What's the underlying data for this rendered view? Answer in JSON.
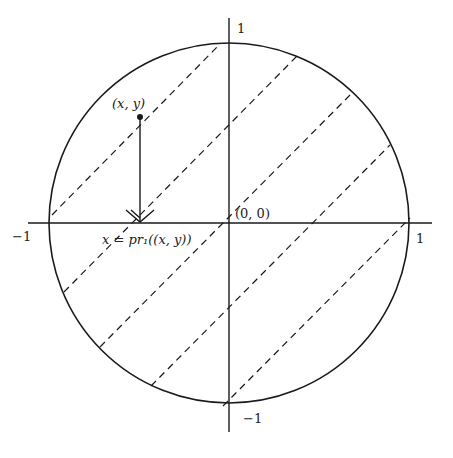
{
  "figure": {
    "type": "unit-disk-projection",
    "colors": {
      "stroke": "#1a1a1a",
      "background": "#ffffff"
    },
    "center_px": [
      229,
      223
    ],
    "radius_px": 180,
    "labels": {
      "y_top": "1",
      "y_bottom": "−1",
      "x_left": "−1",
      "x_right": "1",
      "origin": "(0, 0)",
      "point": "(x, y)",
      "projection": "x = pr₁((x, y))"
    },
    "dashed_chords": [
      {
        "x1": 52,
        "y1": 215,
        "x2": 220,
        "y2": 44
      },
      {
        "x1": 64,
        "y1": 292,
        "x2": 297,
        "y2": 56
      },
      {
        "x1": 100,
        "y1": 347,
        "x2": 352,
        "y2": 93
      },
      {
        "x1": 151,
        "y1": 386,
        "x2": 390,
        "y2": 145
      },
      {
        "x1": 223,
        "y1": 406,
        "x2": 410,
        "y2": 218
      }
    ],
    "point_px": [
      140,
      117
    ],
    "arrow_end_px": [
      140,
      223
    ]
  }
}
